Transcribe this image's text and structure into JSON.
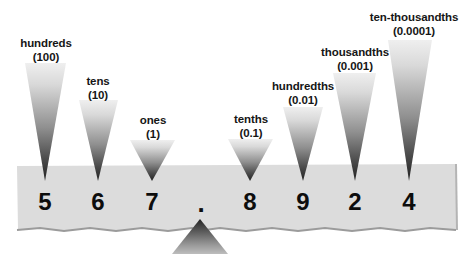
{
  "figure": {
    "kind": "place-value-chart",
    "number_shown": "567.8924",
    "background_color": "#ffffff",
    "band_color": "#dcdcdc",
    "pointer_gradient_light": "#e8e8e8",
    "pointer_gradient_dark": "#2a2a2a",
    "digit_color": "#0d0d0d",
    "label_color": "#161616"
  },
  "places": [
    {
      "id": "hundreds",
      "name": "hundreds",
      "value": "(100)",
      "digit": "5"
    },
    {
      "id": "tens",
      "name": "tens",
      "value": "(10)",
      "digit": "6"
    },
    {
      "id": "ones",
      "name": "ones",
      "value": "(1)",
      "digit": "7"
    },
    {
      "id": "decimal-point",
      "name": "",
      "value": "",
      "digit": "."
    },
    {
      "id": "tenths",
      "name": "tenths",
      "value": "(0.1)",
      "digit": "8"
    },
    {
      "id": "hundredths",
      "name": "hundredths",
      "value": "(0.01)",
      "digit": "9"
    },
    {
      "id": "thousandths",
      "name": "thousandths",
      "value": "(0.001)",
      "digit": "2"
    },
    {
      "id": "ten-thousandths",
      "name": "ten-thousandths",
      "value": "(0.0001)",
      "digit": "4"
    }
  ]
}
